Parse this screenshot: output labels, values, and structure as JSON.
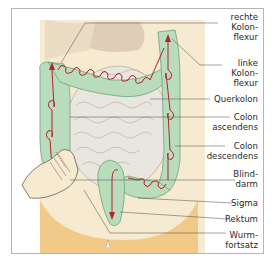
{
  "figure": {
    "labels": [
      {
        "id": "rechte-kolonflexur",
        "text": "rechte\nKolon-\nflexur",
        "top": 12
      },
      {
        "id": "linke-kolonflexur",
        "text": "linke\nKolon-\nflexur",
        "top": 58
      },
      {
        "id": "querkolon",
        "text": "Querkolon",
        "top": 94
      },
      {
        "id": "colon-ascendens",
        "text": "Colon\nascendens",
        "top": 112
      },
      {
        "id": "colon-descendens",
        "text": "Colon\ndescendens",
        "top": 141
      },
      {
        "id": "blinddarm",
        "text": "Blind-\ndarm",
        "top": 169
      },
      {
        "id": "sigma",
        "text": "Sigma",
        "top": 198
      },
      {
        "id": "rektum",
        "text": "Rektum",
        "top": 214
      },
      {
        "id": "wurmfortsatz",
        "text": "Wurm-\nfortsatz",
        "top": 230
      }
    ],
    "colors": {
      "colon_green": "#b9dcbd",
      "colon_outline": "#6fa37a",
      "arrow_red": "#b0242b",
      "skin_light": "#f6ead0",
      "skin_orange": "#f1c988",
      "intestine_gray": "#e9e5df",
      "border": "#b5b5b5"
    }
  }
}
